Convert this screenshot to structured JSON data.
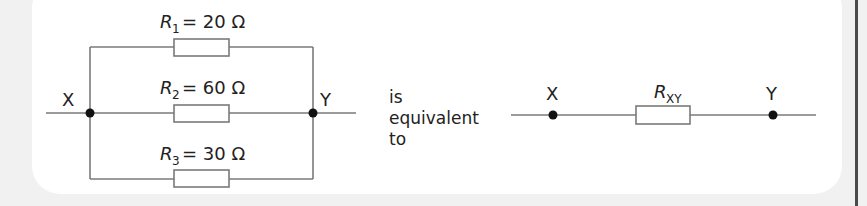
{
  "colors": {
    "wire": "#7a7a7a",
    "dot": "#111111",
    "text": "#222222",
    "panel_bg": "#ffffff",
    "page_bg": "#f1f1f1",
    "edge_bar": "#4a4a4a"
  },
  "parallel_circuit": {
    "node_left": "X",
    "node_right": "Y",
    "resistors": [
      {
        "symbol": "R",
        "subscript": "1",
        "equals": "= 20 Ω"
      },
      {
        "symbol": "R",
        "subscript": "2",
        "equals": "= 60 Ω"
      },
      {
        "symbol": "R",
        "subscript": "3",
        "equals": "= 30 Ω"
      }
    ]
  },
  "connector_text": [
    "is",
    "equivalent",
    "to"
  ],
  "equivalent_circuit": {
    "node_left": "X",
    "node_right": "Y",
    "resistor": {
      "symbol": "R",
      "subscript": "XY"
    }
  }
}
